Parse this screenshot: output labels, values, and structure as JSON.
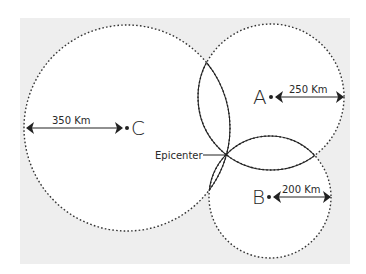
{
  "diagram": {
    "background_color": "#eeeeee",
    "stations": [
      {
        "id": "A",
        "label": "A",
        "distance_label": "250 Km",
        "cx": 271,
        "cy": 97,
        "r": 73
      },
      {
        "id": "B",
        "label": "B",
        "distance_label": "200 Km",
        "cx": 270,
        "cy": 197,
        "r": 61
      },
      {
        "id": "C",
        "label": "C",
        "distance_label": "350 Km",
        "cx": 127,
        "cy": 128,
        "r": 103
      }
    ],
    "epicenter": {
      "label": "Epicenter",
      "x": 229,
      "y": 155
    }
  }
}
